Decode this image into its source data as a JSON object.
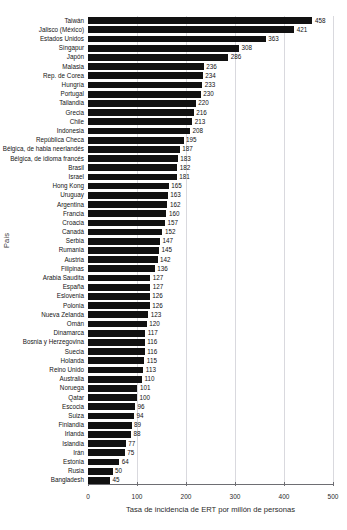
{
  "axis_titles": {
    "y": "País",
    "x": "Tasa de incidencia de ERT por millón de personas"
  },
  "ghost_text": "",
  "chart_data": {
    "type": "bar",
    "orientation": "horizontal",
    "title": "",
    "subtitle": "",
    "xlabel": "Tasa de incidencia de ERT por millón de personas",
    "ylabel": "País",
    "xlim": [
      0,
      500
    ],
    "xticks": [
      0,
      100,
      200,
      300,
      400,
      500
    ],
    "xtick_labels": [
      "0",
      "100",
      "200",
      "300",
      "400",
      "500"
    ],
    "grid": "vertical",
    "legend": "none",
    "sort": "descending",
    "bar_color": "#111111",
    "categories": [
      "Taiwán",
      "Jalisco (México)",
      "Estados Unidos",
      "Singapur",
      "Japón",
      "Malasia",
      "Rep. de Corea",
      "Hungría",
      "Portugal",
      "Tailandia",
      "Grecia",
      "Chile",
      "Indonesia",
      "República Checa",
      "Bélgica, de habla neerlandés",
      "Bélgica, de idioma francés",
      "Brasil",
      "Israel",
      "Hong Kong",
      "Uruguay",
      "Argentina",
      "Francia",
      "Croacia",
      "Canadá",
      "Serbia",
      "Rumania",
      "Austria",
      "Filipinas",
      "Arabia Saudita",
      "España",
      "Eslovenia",
      "Polonia",
      "Nueva Zelanda",
      "Omán",
      "Dinamarca",
      "Bosnia y Herzegovina",
      "Suecia",
      "Holanda",
      "Reino Unido",
      "Australia",
      "Noruega",
      "Qatar",
      "Escocia",
      "Suiza",
      "Finlandia",
      "Irlanda",
      "Islandia",
      "Irán",
      "Estonia",
      "Rusia",
      "Bangladesh"
    ],
    "values": [
      458,
      421,
      363,
      308,
      286,
      236,
      234,
      233,
      230,
      220,
      216,
      213,
      208,
      195,
      187,
      183,
      182,
      181,
      165,
      163,
      162,
      160,
      157,
      152,
      147,
      145,
      142,
      136,
      127,
      127,
      126,
      126,
      123,
      120,
      117,
      116,
      116,
      115,
      113,
      110,
      101,
      100,
      96,
      94,
      89,
      88,
      77,
      75,
      64,
      50,
      45
    ]
  }
}
